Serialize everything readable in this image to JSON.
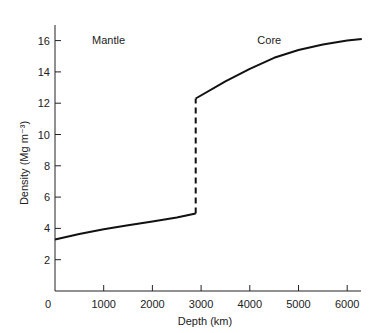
{
  "chart_data": {
    "type": "line",
    "title": "",
    "xlabel": "Depth (km)",
    "ylabel": "Density (Mg m⁻³)",
    "xlim": [
      0,
      6371
    ],
    "ylim": [
      0,
      16.8
    ],
    "x_ticks": [
      0,
      1000,
      2000,
      3000,
      4000,
      5000,
      6000
    ],
    "y_ticks": [
      2,
      4,
      6,
      8,
      10,
      12,
      14,
      16
    ],
    "grid": false,
    "annotations": [
      {
        "text": "Mantle",
        "x": 1100,
        "y": 16.3
      },
      {
        "text": "Core",
        "x": 4400,
        "y": 16.3
      }
    ],
    "series": [
      {
        "name": "Mantle",
        "style": "solid",
        "x": [
          0,
          500,
          1000,
          1500,
          2000,
          2500,
          2890
        ],
        "y": [
          3.3,
          3.65,
          3.95,
          4.2,
          4.45,
          4.7,
          4.95
        ]
      },
      {
        "name": "Core-mantle boundary",
        "style": "dashed",
        "x": [
          2890,
          2890
        ],
        "y": [
          4.95,
          12.3
        ]
      },
      {
        "name": "Core",
        "style": "solid",
        "x": [
          2890,
          3500,
          4000,
          4500,
          5000,
          5500,
          6000,
          6300
        ],
        "y": [
          12.3,
          13.4,
          14.2,
          14.9,
          15.4,
          15.75,
          16.0,
          16.1
        ]
      }
    ]
  }
}
